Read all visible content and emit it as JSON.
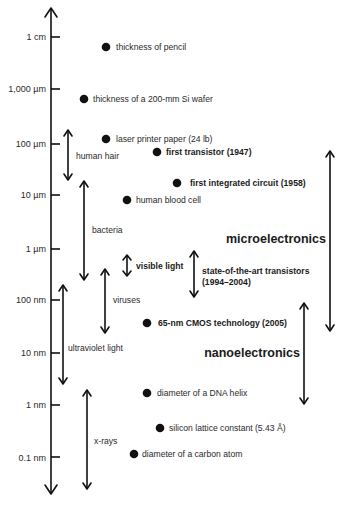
{
  "axis": {
    "direction": "vertical",
    "ticks": [
      "1 cm",
      "1,000 µm",
      "100 µm",
      "10 µm",
      "1 µm",
      "100 nm",
      "10 nm",
      "1 nm",
      "0.1 nm"
    ]
  },
  "points": [
    {
      "label": "thickness of pencil",
      "bold": false
    },
    {
      "label": "thickness of a 200-mm Si wafer",
      "bold": false
    },
    {
      "label": "laser printer paper (24 lb)",
      "bold": false
    },
    {
      "label": "first transistor (1947)",
      "bold": true
    },
    {
      "label": "first integrated circuit (1958)",
      "bold": true
    },
    {
      "label": "human blood cell",
      "bold": false
    },
    {
      "label": "65-nm CMOS technology (2005)",
      "bold": true
    },
    {
      "label": "diameter of a DNA helix",
      "bold": false
    },
    {
      "label": "silicon lattice constant (5.43 Å)",
      "bold": false
    },
    {
      "label": "diameter of a carbon atom",
      "bold": false
    }
  ],
  "ranges": [
    {
      "label": "human hair",
      "bold": false
    },
    {
      "label": "bacteria",
      "bold": false
    },
    {
      "label": "visible light",
      "bold": true
    },
    {
      "label": "viruses",
      "bold": false
    },
    {
      "label": "ultraviolet light",
      "bold": false
    },
    {
      "label": "x-rays",
      "bold": false
    },
    {
      "label_lines": [
        "state-of-the-art transistors",
        "(1994–2004)"
      ],
      "bold": true
    },
    {
      "label": "microelectronics",
      "bold": true,
      "large": true
    },
    {
      "label": "nanoelectronics",
      "bold": true,
      "large": true
    }
  ]
}
